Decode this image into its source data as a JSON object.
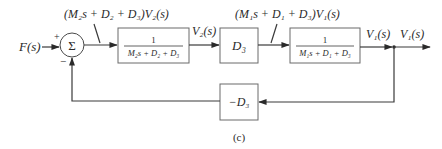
{
  "diagram": {
    "input_label": "F(s)",
    "summing_junction": {
      "symbol": "Σ",
      "plus_sign": "+",
      "minus_sign": "−"
    },
    "annotation_1": "(M₂s + D₂ + D₃)V₂(s)",
    "block_1": {
      "numerator": "1",
      "denominator": "M₂s + D₂ + D₃"
    },
    "signal_v2": "V₂(s)",
    "block_2": {
      "label": "D₃"
    },
    "annotation_2": "(M₁s + D₁ + D₃)V₁(s)",
    "block_3": {
      "numerator": "1",
      "denominator": "M₁s + D₁ + D₃"
    },
    "signal_v1_a": "V₁(s)",
    "signal_v1_b": "V₁(s)",
    "feedback_block": {
      "label": "−D₃"
    },
    "caption": "(c)"
  }
}
